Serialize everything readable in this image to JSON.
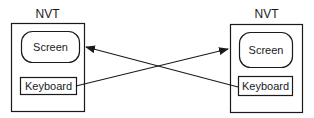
{
  "diagram": {
    "left_terminal": {
      "title": "NVT",
      "screen_label": "Screen",
      "keyboard_label": "Keyboard"
    },
    "right_terminal": {
      "title": "NVT",
      "screen_label": "Screen",
      "keyboard_label": "Keyboard"
    },
    "connections": [
      {
        "from": "left_terminal.keyboard",
        "to": "right_terminal.screen"
      },
      {
        "from": "right_terminal.keyboard",
        "to": "left_terminal.screen"
      }
    ],
    "colors": {
      "stroke": "#1a1a1a",
      "background": "#ffffff"
    }
  }
}
